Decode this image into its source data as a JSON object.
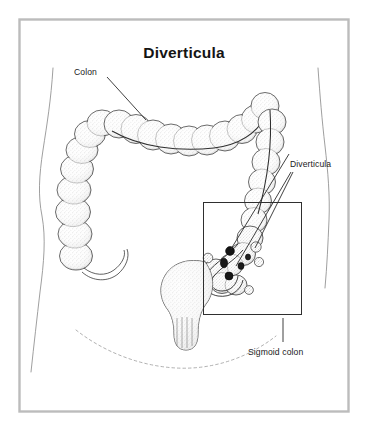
{
  "figure": {
    "title": "Diverticula",
    "frame_color": "#b9b9b9",
    "background_color": "#ffffff",
    "ink_color": "#2b2b2b",
    "labels": {
      "colon": "Colon",
      "diverticula": "Diverticula",
      "sigmoid_colon": "Sigmoid colon"
    },
    "parts": {
      "body_outline": "torso-silhouette",
      "large_intestine": "colon-haustra-chain",
      "rectum": "rectum-bulb",
      "detail_box": "diverticula-detail-box",
      "pelvic_arc": "dotted-pelvic-outline"
    }
  }
}
